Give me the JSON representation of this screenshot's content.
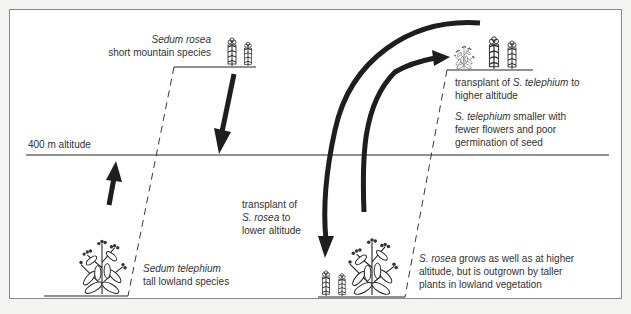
{
  "diagram": {
    "type": "reciprocal transplant experiment",
    "altitude_line_label": "400 m altitude",
    "upper_left": {
      "species_italic": "Sedum rosea",
      "description": "short mountain species"
    },
    "lower_left": {
      "species_italic": "Sedum telephium",
      "description": "tall lowland species"
    },
    "upper_right": {
      "line1_pre": "transplant of ",
      "line1_italic": "S. telephium",
      "line1_post": " to",
      "line2": "higher altitude",
      "result_italic": "S. telephium",
      "result_line1_post": " smaller with",
      "result_line2": "fewer flowers and poor",
      "result_line3": "germination of seed"
    },
    "middle": {
      "line1": "transplant of",
      "line2_italic": "S. rosea",
      "line2_post": " to",
      "line3": "lower altitude"
    },
    "lower_right": {
      "line1_italic": "S. rosea",
      "line1_post": " grows as well as at higher",
      "line2": "altitude, but is outgrown by taller",
      "line3": "plants in lowland vegetation"
    },
    "colors": {
      "ink": "#1e1e1e",
      "frame": "#8a8a8a",
      "paper": "#ffffff",
      "background": "#f4f4f2"
    }
  }
}
